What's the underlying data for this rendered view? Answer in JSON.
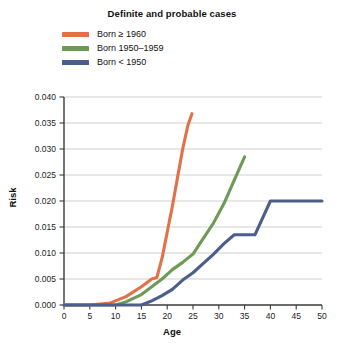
{
  "chart_data": {
    "type": "line",
    "title": "Definite and probable cases",
    "xlabel": "Age",
    "ylabel": "Risk",
    "xlim": [
      0,
      50
    ],
    "ylim": [
      0.0,
      0.04
    ],
    "grid": true,
    "legend_position": "top-left",
    "xticks": [
      0,
      5,
      10,
      15,
      20,
      25,
      30,
      35,
      40,
      45,
      50
    ],
    "xtick_labels": [
      "0",
      "5",
      "10",
      "15",
      "20",
      "25",
      "30",
      "35",
      "40",
      "45",
      "50"
    ],
    "yticks": [
      0.0,
      0.005,
      0.01,
      0.015,
      0.02,
      0.025,
      0.03,
      0.035,
      0.04
    ],
    "ytick_labels": [
      "0.000",
      "0.005",
      "0.010",
      "0.015",
      "0.020",
      "0.025",
      "0.030",
      "0.035",
      "0.040"
    ],
    "series": [
      {
        "name": "Born ≥ 1960",
        "color": "#E2714A",
        "points": [
          [
            0,
            0.0
          ],
          [
            5,
            0.0
          ],
          [
            9,
            0.0004
          ],
          [
            12,
            0.0016
          ],
          [
            15,
            0.0035
          ],
          [
            17,
            0.005
          ],
          [
            18,
            0.0053
          ],
          [
            19,
            0.009
          ],
          [
            20,
            0.014
          ],
          [
            21,
            0.019
          ],
          [
            22,
            0.0245
          ],
          [
            23,
            0.03
          ],
          [
            24,
            0.0345
          ],
          [
            24.8,
            0.0368
          ]
        ]
      },
      {
        "name": "Born 1950–1959",
        "color": "#6D9A55",
        "points": [
          [
            0,
            0.0
          ],
          [
            10,
            0.0
          ],
          [
            12,
            0.0006
          ],
          [
            15,
            0.002
          ],
          [
            17,
            0.0035
          ],
          [
            19,
            0.005
          ],
          [
            21,
            0.0068
          ],
          [
            23,
            0.0082
          ],
          [
            25,
            0.0098
          ],
          [
            27,
            0.0128
          ],
          [
            29,
            0.0158
          ],
          [
            31,
            0.0195
          ],
          [
            33,
            0.024
          ],
          [
            35,
            0.0285
          ]
        ]
      },
      {
        "name": "Born < 1950",
        "color": "#4C5E8B",
        "points": [
          [
            0,
            0.0
          ],
          [
            15,
            0.0
          ],
          [
            17,
            0.0008
          ],
          [
            19,
            0.0018
          ],
          [
            21,
            0.003
          ],
          [
            23,
            0.0048
          ],
          [
            25,
            0.0062
          ],
          [
            27,
            0.008
          ],
          [
            29,
            0.0098
          ],
          [
            31,
            0.0118
          ],
          [
            33,
            0.0135
          ],
          [
            37,
            0.0135
          ],
          [
            40,
            0.02
          ],
          [
            45,
            0.02
          ],
          [
            50,
            0.02
          ]
        ]
      }
    ]
  },
  "legend": {
    "items": [
      {
        "label": "Born ≥ 1960",
        "color": "#E2714A"
      },
      {
        "label": "Born 1950–1959",
        "color": "#6D9A55"
      },
      {
        "label": "Born < 1950",
        "color": "#4C5E8B"
      }
    ]
  },
  "colors": {
    "grid": "#c9c9c9",
    "axis": "#3a3a3a",
    "background": "#ffffff",
    "text": "#111111"
  }
}
